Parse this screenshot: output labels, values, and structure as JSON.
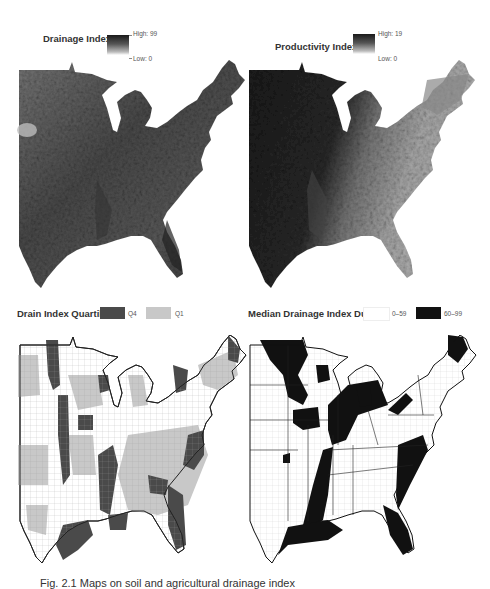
{
  "figure": {
    "panels": [
      {
        "id": "top-left",
        "legend_title": "Drainage Index:",
        "legend_type": "gradient",
        "legend_high": "High: 99",
        "legend_low": "Low: 0",
        "map_description": "Continuous grayscale raster of Drainage Index across the eastern United States"
      },
      {
        "id": "top-right",
        "legend_title": "Productivity Index:",
        "legend_type": "gradient",
        "legend_high": "High: 19",
        "legend_low": "Low: 0",
        "map_description": "Continuous grayscale raster of Productivity Index across the eastern United States"
      },
      {
        "id": "bottom-left",
        "legend_title": "Drain Index Quartiles",
        "legend_type": "categorical",
        "categories": [
          {
            "label": "Q4",
            "color": "#4a4a4a"
          },
          {
            "label": "Q1",
            "color": "#c8c8c8"
          }
        ],
        "map_description": "County-level map of eastern US with counties in Drain Index Q4 (dark) and Q1 (light gray)"
      },
      {
        "id": "bottom-right",
        "legend_title": "Median Drainage Index Dummy",
        "legend_type": "categorical",
        "categories": [
          {
            "label": "0–59",
            "color": "#ffffff"
          },
          {
            "label": "60–99",
            "color": "#111111"
          }
        ],
        "map_description": "County-level map of eastern US with counties of median drainage index 60–99 in black"
      }
    ],
    "caption": "Fig. 2.1  Maps on soil and agricultural drainage index"
  },
  "colors": {
    "dark": "#111111",
    "q4": "#4a4a4a",
    "q1": "#c8c8c8",
    "background": "#ffffff"
  }
}
